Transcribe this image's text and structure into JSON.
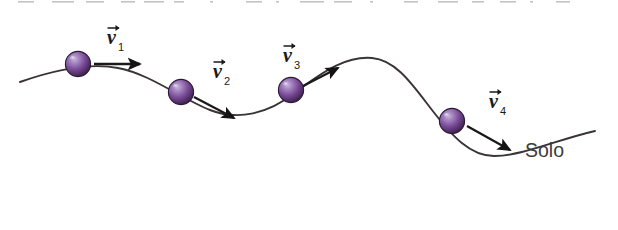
{
  "figure": {
    "type": "physics-diagram",
    "description_label": "Ball rolling over wavy ground with velocity vectors",
    "ground_label": "Solo",
    "credit": "Banco de imagens/Arquivo da editora",
    "background_color": "#ffffff",
    "curve_color": "#3a3338",
    "arrow_color": "#1a1a1a",
    "label_color": "#1a1a1a",
    "ground_label_color": "#3c3c3c",
    "credit_color": "#5d5d5d",
    "ball": {
      "color_light": "#b9a0cf",
      "color_mid": "#7d4f99",
      "color_dark": "#41264f",
      "outline": "#2b1a33"
    },
    "top_marks_color": "#b9b9bd",
    "vectors": [
      {
        "id": "v1",
        "symbol": "v",
        "subscript": "1",
        "label": "v⃗1",
        "cx": 78,
        "cy": 64,
        "x1": 94,
        "y1": 64,
        "x2": 140,
        "y2": 64,
        "label_x": 107,
        "label_y": 44
      },
      {
        "id": "v2",
        "symbol": "v",
        "subscript": "2",
        "label": "v⃗2",
        "cx": 181,
        "cy": 92,
        "x1": 194,
        "y1": 97,
        "x2": 234,
        "y2": 118,
        "label_x": 213,
        "label_y": 78
      },
      {
        "id": "v3",
        "symbol": "v",
        "subscript": "3",
        "label": "v⃗3",
        "cx": 291,
        "cy": 90,
        "x1": 303,
        "y1": 86,
        "x2": 338,
        "y2": 68,
        "label_x": 283,
        "label_y": 62
      },
      {
        "id": "v4",
        "symbol": "v",
        "subscript": "4",
        "label": "v⃗4",
        "cx": 452,
        "cy": 121,
        "x1": 467,
        "y1": 126,
        "x2": 510,
        "y2": 150,
        "label_x": 489,
        "label_y": 108
      }
    ],
    "ground_label_pos": {
      "x": 525,
      "y": 157
    },
    "curve_path": "M 20,82 C 60,68 92,63 118,68 C 150,74 180,98 210,110 C 238,121 268,114 296,92 C 326,69 348,56 372,58 C 396,60 412,84 432,110 C 452,136 470,156 494,156 C 522,156 556,140 595,131",
    "top_marks": [
      {
        "x": 18,
        "w": 16
      },
      {
        "x": 52,
        "w": 22
      },
      {
        "x": 86,
        "w": 18
      },
      {
        "x": 121,
        "w": 14
      },
      {
        "x": 144,
        "w": 20
      },
      {
        "x": 174,
        "w": 10
      },
      {
        "x": 210,
        "w": 3
      },
      {
        "x": 246,
        "w": 16
      },
      {
        "x": 276,
        "w": 3
      },
      {
        "x": 300,
        "w": 24
      },
      {
        "x": 334,
        "w": 18
      },
      {
        "x": 370,
        "w": 3
      },
      {
        "x": 404,
        "w": 14
      },
      {
        "x": 438,
        "w": 20
      },
      {
        "x": 472,
        "w": 12
      },
      {
        "x": 500,
        "w": 16
      },
      {
        "x": 530,
        "w": 3
      },
      {
        "x": 556,
        "w": 14
      }
    ]
  }
}
